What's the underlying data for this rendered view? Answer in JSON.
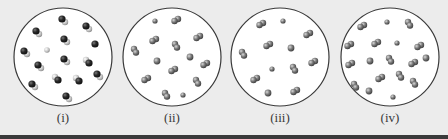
{
  "figure": {
    "background": "#ececec",
    "circle_stroke": "#3a3a3a",
    "circle_fill": "#ffffff",
    "colors": {
      "dark_atom": "#1e1e1e",
      "grey_atom": "#6e6e6e",
      "light_atom": "#c8c8c8"
    },
    "panels": [
      {
        "label": "(i)",
        "cx": 63,
        "cy": 57,
        "r": 49,
        "molecules": [
          {
            "x": 63,
            "y": 20,
            "kind": "dark-light"
          },
          {
            "x": 37,
            "y": 32,
            "kind": "dark-light"
          },
          {
            "x": 87,
            "y": 27,
            "kind": "dark-light"
          },
          {
            "x": 65,
            "y": 40,
            "kind": "dark-light"
          },
          {
            "x": 47,
            "y": 50,
            "kind": "light-single"
          },
          {
            "x": 95,
            "y": 44,
            "kind": "dark-single"
          },
          {
            "x": 25,
            "y": 52,
            "kind": "dark-light"
          },
          {
            "x": 65,
            "y": 60,
            "kind": "dark-light"
          },
          {
            "x": 39,
            "y": 66,
            "kind": "dark-light"
          },
          {
            "x": 88,
            "y": 62,
            "kind": "light-dark"
          },
          {
            "x": 57,
            "y": 79,
            "kind": "light-dark"
          },
          {
            "x": 78,
            "y": 80,
            "kind": "light-dark"
          },
          {
            "x": 33,
            "y": 85,
            "kind": "dark-light"
          },
          {
            "x": 98,
            "y": 75,
            "kind": "dark-light"
          },
          {
            "x": 67,
            "y": 97,
            "kind": "dark-light"
          }
        ]
      },
      {
        "label": "(ii)",
        "cx": 172,
        "cy": 57,
        "r": 49,
        "molecules": [
          {
            "x": 155,
            "y": 21,
            "kind": "grey-small"
          },
          {
            "x": 176,
            "y": 20,
            "kind": "grey-pair"
          },
          {
            "x": 154,
            "y": 40,
            "kind": "grey-pair"
          },
          {
            "x": 198,
            "y": 37,
            "kind": "grey-pair"
          },
          {
            "x": 176,
            "y": 46,
            "kind": "grey-pair-v"
          },
          {
            "x": 135,
            "y": 51,
            "kind": "grey-pair-v"
          },
          {
            "x": 157,
            "y": 61,
            "kind": "grey-single"
          },
          {
            "x": 190,
            "y": 57,
            "kind": "grey-single"
          },
          {
            "x": 205,
            "y": 64,
            "kind": "grey-pair"
          },
          {
            "x": 173,
            "y": 70,
            "kind": "grey-pair"
          },
          {
            "x": 146,
            "y": 79,
            "kind": "grey-pair"
          },
          {
            "x": 197,
            "y": 82,
            "kind": "grey-pair-v"
          },
          {
            "x": 166,
            "y": 95,
            "kind": "grey-pair-v"
          },
          {
            "x": 183,
            "y": 95,
            "kind": "grey-small"
          }
        ]
      },
      {
        "label": "(iii)",
        "cx": 280,
        "cy": 57,
        "r": 49,
        "molecules": [
          {
            "x": 261,
            "y": 24,
            "kind": "grey-pair"
          },
          {
            "x": 283,
            "y": 21,
            "kind": "grey-small"
          },
          {
            "x": 308,
            "y": 34,
            "kind": "grey-pair"
          },
          {
            "x": 268,
            "y": 45,
            "kind": "grey-pair"
          },
          {
            "x": 291,
            "y": 48,
            "kind": "grey-single"
          },
          {
            "x": 243,
            "y": 54,
            "kind": "grey-pair-v"
          },
          {
            "x": 313,
            "y": 62,
            "kind": "grey-pair"
          },
          {
            "x": 272,
            "y": 69,
            "kind": "grey-small"
          },
          {
            "x": 294,
            "y": 69,
            "kind": "grey-pair-v"
          },
          {
            "x": 255,
            "y": 79,
            "kind": "grey-pair"
          },
          {
            "x": 268,
            "y": 93,
            "kind": "grey-single"
          },
          {
            "x": 295,
            "y": 91,
            "kind": "grey-pair"
          }
        ]
      },
      {
        "label": "(iv)",
        "cx": 390,
        "cy": 57,
        "r": 49,
        "molecules": [
          {
            "x": 362,
            "y": 26,
            "kind": "grey-pair"
          },
          {
            "x": 387,
            "y": 22,
            "kind": "grey-small"
          },
          {
            "x": 409,
            "y": 24,
            "kind": "grey-pair-v"
          },
          {
            "x": 349,
            "y": 45,
            "kind": "grey-pair"
          },
          {
            "x": 376,
            "y": 43,
            "kind": "grey-pair"
          },
          {
            "x": 397,
            "y": 43,
            "kind": "grey-small"
          },
          {
            "x": 419,
            "y": 46,
            "kind": "grey-pair"
          },
          {
            "x": 350,
            "y": 64,
            "kind": "grey-pair"
          },
          {
            "x": 370,
            "y": 61,
            "kind": "grey-single"
          },
          {
            "x": 390,
            "y": 60,
            "kind": "grey-pair-v"
          },
          {
            "x": 413,
            "y": 63,
            "kind": "grey-pair"
          },
          {
            "x": 426,
            "y": 58,
            "kind": "grey-single"
          },
          {
            "x": 380,
            "y": 78,
            "kind": "grey-pair"
          },
          {
            "x": 400,
            "y": 76,
            "kind": "grey-pair-v"
          },
          {
            "x": 355,
            "y": 86,
            "kind": "grey-pair-v"
          },
          {
            "x": 369,
            "y": 91,
            "kind": "grey-single"
          },
          {
            "x": 414,
            "y": 83,
            "kind": "grey-pair-v"
          },
          {
            "x": 393,
            "y": 97,
            "kind": "grey-small"
          }
        ]
      }
    ]
  }
}
